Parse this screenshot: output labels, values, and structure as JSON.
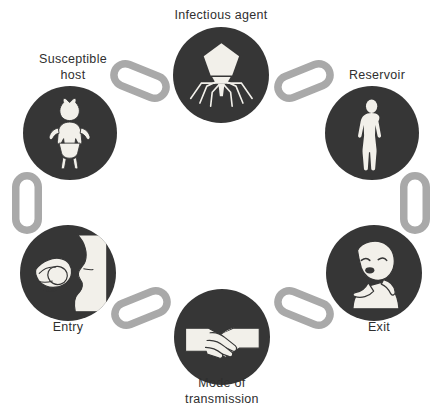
{
  "diagram": {
    "type": "cycle-diagram",
    "background_color": "#ffffff",
    "node_color": "#363636",
    "chain_color": "#a9a9a9",
    "label_color": "#2f2f2f",
    "icon_color": "#f2f0ea"
  },
  "nodes": [
    {
      "id": "infectious-agent",
      "label": "Infectious agent",
      "icon": "bacteriophage-icon",
      "position": "top",
      "cx": 221,
      "cy": 75,
      "r": 48,
      "label_x": 221,
      "label_y": 8
    },
    {
      "id": "reservoir",
      "label": "Reservoir",
      "icon": "standing-human-figure-icon",
      "position": "top-right",
      "cx": 372,
      "cy": 133,
      "r": 47,
      "label_x": 377,
      "label_y": 68
    },
    {
      "id": "exit",
      "label": "Exit",
      "icon": "coughing-person-icon",
      "position": "bottom-right",
      "cx": 374,
      "cy": 273,
      "r": 48,
      "label_x": 379,
      "label_y": 320
    },
    {
      "id": "mode-of-transmission",
      "label": "Mode of\ntransmission",
      "icon": "handshake-icon",
      "position": "bottom",
      "cx": 222,
      "cy": 337,
      "r": 48,
      "label_x": 222,
      "label_y": 376
    },
    {
      "id": "entry",
      "label": "Entry",
      "icon": "hand-food-to-mouth-icon",
      "position": "bottom-left",
      "cx": 68,
      "cy": 273,
      "r": 48,
      "label_x": 68,
      "label_y": 320
    },
    {
      "id": "susceptible-host",
      "label": "Susceptible\nhost",
      "icon": "infant-figure-icon",
      "position": "top-left",
      "cx": 70,
      "cy": 133,
      "r": 47,
      "label_x": 73,
      "label_y": 52
    }
  ],
  "chains": [
    {
      "id": "chain-susceptible-to-agent",
      "from": "susceptible-host",
      "to": "infectious-agent",
      "x": 109,
      "y": 66,
      "w": 62,
      "h": 30,
      "rotate": 22
    },
    {
      "id": "chain-agent-to-reservoir",
      "from": "infectious-agent",
      "to": "reservoir",
      "x": 273,
      "y": 66,
      "w": 62,
      "h": 30,
      "rotate": -22
    },
    {
      "id": "chain-reservoir-to-exit",
      "from": "reservoir",
      "to": "exit",
      "x": 400,
      "y": 172,
      "w": 30,
      "h": 62,
      "rotate": 0
    },
    {
      "id": "chain-exit-to-transmission",
      "from": "exit",
      "to": "mode-of-transmission",
      "x": 273,
      "y": 293,
      "w": 62,
      "h": 30,
      "rotate": 22
    },
    {
      "id": "chain-transmission-to-entry",
      "from": "mode-of-transmission",
      "to": "entry",
      "x": 110,
      "y": 293,
      "w": 62,
      "h": 30,
      "rotate": -22
    },
    {
      "id": "chain-entry-to-susceptible",
      "from": "entry",
      "to": "susceptible-host",
      "x": 12,
      "y": 172,
      "w": 30,
      "h": 62,
      "rotate": 0
    }
  ]
}
